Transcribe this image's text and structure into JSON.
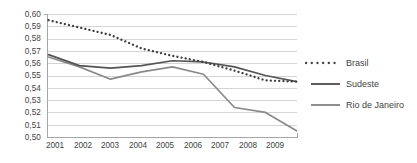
{
  "chart_data": {
    "type": "line",
    "title": "",
    "xlabel": "",
    "ylabel": "",
    "x": [
      2001,
      2002,
      2003,
      2004,
      2005,
      2006,
      2007,
      2008,
      2009
    ],
    "categories": [
      "2001",
      "2002",
      "2003",
      "2004",
      "2005",
      "2006",
      "2007",
      "2008",
      "2009"
    ],
    "ylim": [
      0.5,
      0.6
    ],
    "ytick_labels": [
      "0,60",
      "0,59",
      "0,58",
      "0,57",
      "0,56",
      "0,55",
      "0,54",
      "0,53",
      "0,52",
      "0,51",
      "0,50"
    ],
    "ytick_values": [
      0.6,
      0.59,
      0.58,
      0.57,
      0.56,
      0.55,
      0.54,
      0.53,
      0.52,
      0.51,
      0.5
    ],
    "grid": true,
    "legend_position": "right",
    "series": [
      {
        "name": "Brasil",
        "style": "dotted",
        "color": "#404040",
        "values": [
          0.595,
          0.589,
          0.583,
          0.572,
          0.566,
          0.561,
          0.554,
          0.546,
          0.545
        ]
      },
      {
        "name": "Sudeste",
        "style": "solid",
        "color": "#555555",
        "values": [
          0.567,
          0.558,
          0.556,
          0.558,
          0.562,
          0.561,
          0.557,
          0.55,
          0.545
        ]
      },
      {
        "name": "Rio de Janeiro",
        "style": "solid",
        "color": "#8a8a8a",
        "values": [
          0.565,
          0.557,
          0.547,
          0.553,
          0.557,
          0.551,
          0.524,
          0.52,
          0.505
        ]
      }
    ]
  },
  "legend": {
    "items": [
      {
        "label": "Brasil",
        "style": "dotted"
      },
      {
        "label": "Sudeste",
        "style": "solid"
      },
      {
        "label": "Rio de Janeiro",
        "style": "solid"
      }
    ]
  },
  "colors": {
    "grid": "#d4d4d4",
    "axis": "#a6a6a6",
    "text": "#3f3f3f",
    "brasil": "#404040",
    "sudeste": "#555555",
    "rio": "#8a8a8a",
    "background": "#ffffff"
  }
}
